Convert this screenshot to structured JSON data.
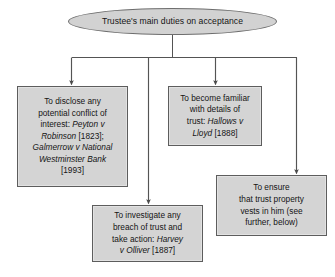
{
  "diagram": {
    "type": "flowchart",
    "title": "Trustee's main duties on acceptance",
    "orientation": "top-down",
    "colors": {
      "node_fill": "#d4d4d4",
      "node_border": "#5d5d5d",
      "root_fill": "#d2d2d2",
      "root_border": "#6e6e6e",
      "connector": "#545454",
      "background": "#ffffff"
    },
    "root": {
      "id": "root",
      "shape": "ellipse",
      "label": "Trustee's main duties on acceptance"
    },
    "nodes": [
      {
        "id": "disclose-conflict",
        "shape": "rectangle",
        "label": "To disclose any potential conflict of interest: Peyton v Robinson [1823]; Galmerrow v National Westminster Bank [1993]",
        "lines": [
          {
            "text": "To disclose any",
            "italic": false
          },
          {
            "text": "potential conflict of",
            "italic": false
          },
          {
            "text": "interest: ",
            "italic": false
          },
          {
            "text": "Peyton v",
            "italic": true
          },
          {
            "text": "Robinson",
            "italic": true
          },
          {
            "text": " [1823];",
            "italic": false
          },
          {
            "text": "Galmerrow v National",
            "italic": true
          },
          {
            "text": "Westminster Bank",
            "italic": true
          },
          {
            "text": "[1993]",
            "italic": false
          }
        ],
        "cases": [
          {
            "name": "Peyton v Robinson",
            "year": "[1823]"
          },
          {
            "name": "Galmerrow v National Westminster Bank",
            "year": "[1993]"
          }
        ]
      },
      {
        "id": "become-familiar",
        "shape": "rectangle",
        "label": "To become familiar with details of trust: Hallows v Lloyd [1888]",
        "cases": [
          {
            "name": "Hallows v Lloyd",
            "year": "[1888]"
          }
        ]
      },
      {
        "id": "investigate-breach",
        "shape": "rectangle",
        "label": "To investigate any breach of trust and take action: Harvey v Olliver [1887]",
        "cases": [
          {
            "name": "Harvey v Olliver",
            "year": "[1887]"
          }
        ]
      },
      {
        "id": "ensure-vesting",
        "shape": "rectangle",
        "label": "To ensure that trust property vests in him (see further, below)",
        "cases": []
      }
    ],
    "edges": [
      {
        "from": "root",
        "to": "disclose-conflict",
        "arrow": true
      },
      {
        "from": "root",
        "to": "become-familiar",
        "arrow": true
      },
      {
        "from": "root",
        "to": "investigate-breach",
        "arrow": true
      },
      {
        "from": "root",
        "to": "ensure-vesting",
        "arrow": true
      }
    ],
    "node_text": {
      "disclose_conflict": {
        "l1": "To disclose any",
        "l2": "potential conflict of",
        "l3_plain": "interest: ",
        "l3_italic": "Peyton v",
        "l4_italic": "Robinson",
        "l4_plain": " [1823];",
        "l5_italic": "Galmerrow v National",
        "l6_italic": "Westminster Bank",
        "l7": "[1993]"
      },
      "become_familiar": {
        "l1": "To become familiar",
        "l2": "with details of",
        "l3_plain": "trust: ",
        "l3_italic": "Hallows v",
        "l4_italic": "Lloyd",
        "l4_plain": " [1888]"
      },
      "investigate_breach": {
        "l1": "To investigate any",
        "l2": "breach of trust and",
        "l3_plain": "take action: ",
        "l3_italic": "Harvey",
        "l4_italic": "v Olliver",
        "l4_plain": " [1887]"
      },
      "ensure_vesting": {
        "l1": "To ensure",
        "l2": "that trust property",
        "l3": "vests in him (see",
        "l4": "further, below)"
      }
    }
  }
}
